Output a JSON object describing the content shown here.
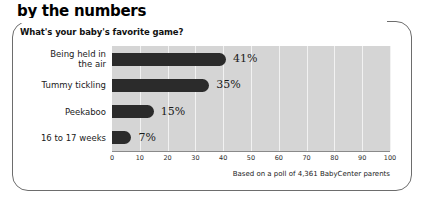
{
  "header": {
    "kicker": "by the numbers"
  },
  "panel": {
    "question": "What's your baby's favorite game?",
    "source": "Based on a poll of 4,361 BabyCenter parents"
  },
  "chart_data": {
    "type": "bar",
    "orientation": "horizontal",
    "title": "What's your baby's favorite game?",
    "xlabel": "",
    "ylabel": "",
    "xlim": [
      0,
      100
    ],
    "grid": true,
    "legend": null,
    "categories": [
      "Being held in the air",
      "Tummy tickling",
      "Peekaboo",
      "16 to 17 weeks"
    ],
    "category_lines": [
      [
        "Being held in",
        "the air"
      ],
      [
        "Tummy tickling"
      ],
      [
        "Peekaboo"
      ],
      [
        "16 to 17 weeks"
      ]
    ],
    "values": [
      41,
      35,
      15,
      7
    ],
    "value_labels": [
      "41%",
      "35%",
      "15%",
      "7%"
    ],
    "ticks": [
      0,
      10,
      20,
      30,
      40,
      50,
      60,
      70,
      80,
      90,
      100
    ],
    "tick_labels": [
      "0",
      "10",
      "20",
      "30",
      "40",
      "50",
      "60",
      "70",
      "80",
      "90",
      "100"
    ],
    "colors": {
      "bar": "#2b2b2b",
      "plot_background": "#d5d5d5",
      "gridline": "#f2f2f2",
      "axis": "#8a8a8a",
      "text": "#1a1a1a"
    },
    "annotation": "Based on a poll of 4,361 BabyCenter parents"
  }
}
